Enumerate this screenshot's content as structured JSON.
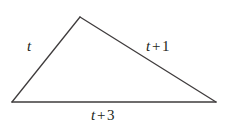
{
  "figure": {
    "kind": "triangle-diagram",
    "background_color": "#ffffff",
    "stroke_color": "#3f3c3d",
    "stroke_width": 1.3,
    "text_color": "#231f20",
    "width": 227,
    "height": 128,
    "vertices": {
      "apex": {
        "x": 80,
        "y": 17
      },
      "bottom_left": {
        "x": 12,
        "y": 102
      },
      "bottom_right": {
        "x": 216,
        "y": 102
      }
    },
    "labels": {
      "left_side": "t",
      "right_side": {
        "variable": "t",
        "operator": "+",
        "number": "1",
        "full": "t + 1"
      },
      "base": {
        "variable": "t",
        "operator": "+",
        "number": "3",
        "full": "t + 3"
      }
    }
  }
}
